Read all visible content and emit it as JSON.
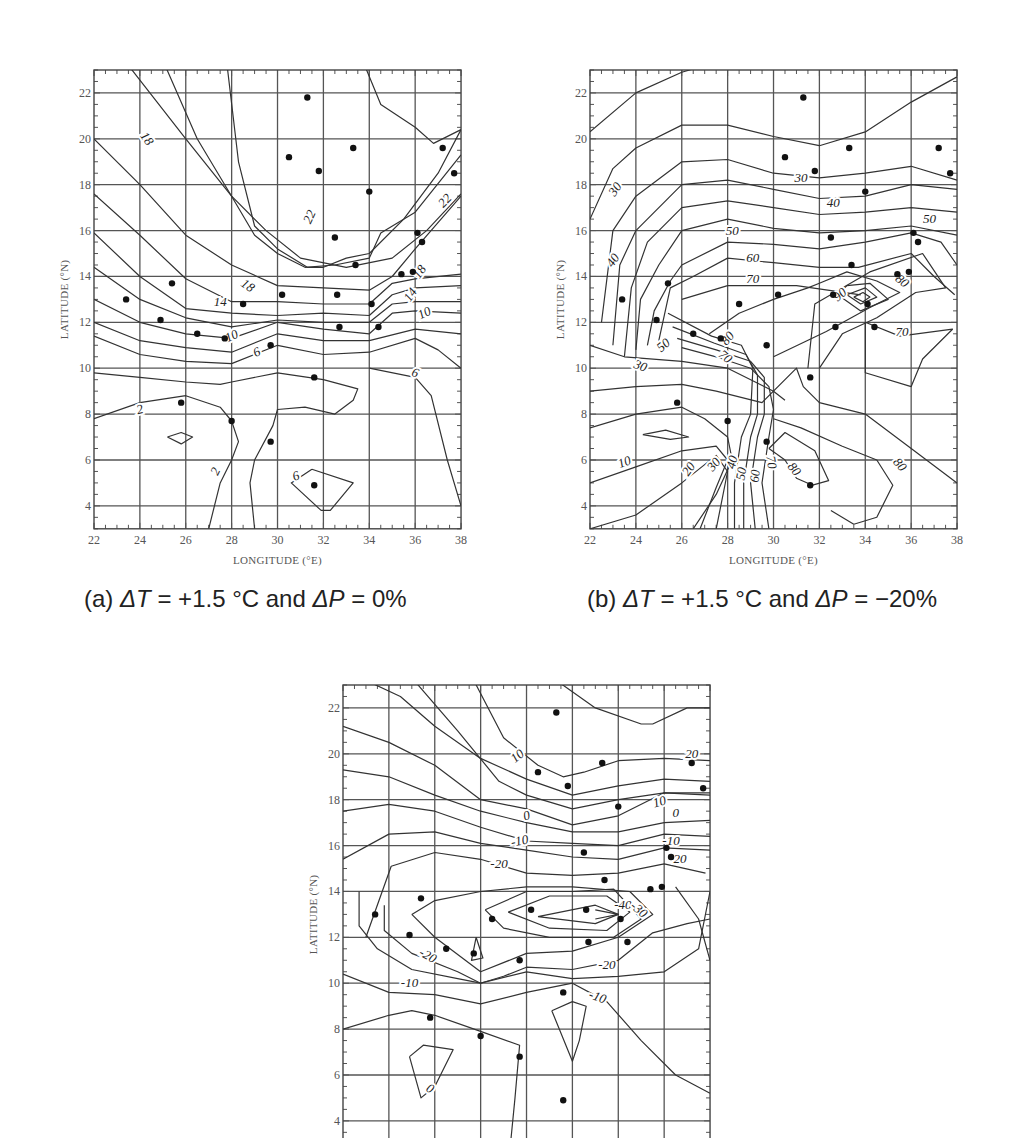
{
  "figure": {
    "panels": [
      {
        "id": "a",
        "caption_prefix": "(a) ",
        "caption_dT": "ΔT",
        "caption_mid": " = +1.5 °C and ",
        "caption_dP": "ΔP",
        "caption_end": " = 0%"
      },
      {
        "id": "b",
        "caption_prefix": "(b) ",
        "caption_dT": "ΔT",
        "caption_mid": " = +1.5 °C and ",
        "caption_dP": "ΔP",
        "caption_end": " = −20%"
      },
      {
        "id": "c",
        "caption_prefix": "",
        "caption_dT": "",
        "caption_mid": "",
        "caption_dP": "",
        "caption_end": ""
      }
    ],
    "xlabel": "LONGITUDE (°E)",
    "ylabel": "LATITUDE (°N)",
    "x_ticks": [
      "22",
      "24",
      "26",
      "28",
      "30",
      "32",
      "34",
      "36",
      "38"
    ],
    "y_ticks": [
      "4",
      "6",
      "8",
      "10",
      "12",
      "14",
      "16",
      "18",
      "20",
      "22"
    ]
  },
  "chart_data": [
    {
      "type": "contour",
      "title": "(a) ΔT = +1.5 °C and ΔP = 0%",
      "xlabel": "LONGITUDE (°E)",
      "ylabel": "LATITUDE (°N)",
      "xlim": [
        22,
        38
      ],
      "ylim": [
        3,
        23
      ],
      "x_ticks": [
        22,
        24,
        26,
        28,
        30,
        32,
        34,
        36,
        38
      ],
      "y_ticks": [
        4,
        6,
        8,
        10,
        12,
        14,
        16,
        18,
        20,
        22
      ],
      "grid": true,
      "contour_labels": [
        18,
        22,
        22,
        18,
        18,
        14,
        14,
        10,
        10,
        6,
        6,
        6,
        2,
        2
      ],
      "contour_levels_range": [
        2,
        22
      ],
      "stations": [
        [
          31.3,
          21.8
        ],
        [
          30.5,
          19.2
        ],
        [
          31.8,
          18.6
        ],
        [
          33.3,
          19.6
        ],
        [
          34.0,
          17.7
        ],
        [
          37.2,
          19.6
        ],
        [
          37.7,
          18.5
        ],
        [
          32.5,
          15.7
        ],
        [
          36.1,
          15.9
        ],
        [
          36.3,
          15.5
        ],
        [
          33.4,
          14.5
        ],
        [
          35.4,
          14.1
        ],
        [
          35.9,
          14.2
        ],
        [
          23.4,
          13.0
        ],
        [
          25.4,
          13.7
        ],
        [
          24.9,
          12.1
        ],
        [
          26.5,
          11.5
        ],
        [
          27.7,
          11.3
        ],
        [
          28.5,
          12.8
        ],
        [
          30.2,
          13.2
        ],
        [
          32.6,
          13.2
        ],
        [
          34.1,
          12.8
        ],
        [
          32.7,
          11.8
        ],
        [
          34.4,
          11.8
        ],
        [
          29.7,
          11.0
        ],
        [
          31.6,
          9.6
        ],
        [
          25.8,
          8.5
        ],
        [
          28.0,
          7.7
        ],
        [
          29.7,
          6.8
        ],
        [
          31.6,
          4.9
        ]
      ]
    },
    {
      "type": "contour",
      "title": "(b) ΔT = +1.5 °C and ΔP = −20%",
      "xlabel": "LONGITUDE (°E)",
      "ylabel": "LATITUDE (°N)",
      "xlim": [
        22,
        38
      ],
      "ylim": [
        3,
        23
      ],
      "x_ticks": [
        22,
        24,
        26,
        28,
        30,
        32,
        34,
        36,
        38
      ],
      "y_ticks": [
        4,
        6,
        8,
        10,
        12,
        14,
        16,
        18,
        20,
        22
      ],
      "grid": true,
      "contour_labels": [
        30,
        30,
        40,
        40,
        50,
        50,
        60,
        70,
        80,
        90,
        70,
        30,
        80,
        70,
        60,
        10,
        20,
        30,
        40,
        50,
        60,
        70,
        80,
        80
      ],
      "contour_levels_range": [
        10,
        90
      ],
      "stations": "same as panel (a)"
    },
    {
      "type": "contour",
      "title": "",
      "xlabel": "LONGITUDE (°E)",
      "ylabel": "LATITUDE (°N)",
      "xlim": [
        22,
        38
      ],
      "ylim": [
        3,
        23
      ],
      "y_ticks": [
        4,
        6,
        8,
        10,
        12,
        14,
        16,
        18,
        20,
        22
      ],
      "grid": true,
      "contour_labels": [
        10,
        20,
        0,
        10,
        0,
        -10,
        -10,
        -20,
        -20,
        -40,
        -30,
        -20,
        -20,
        -10,
        -10,
        0
      ],
      "contour_levels_range": [
        -40,
        20
      ],
      "stations": "same as panel (a)"
    }
  ]
}
